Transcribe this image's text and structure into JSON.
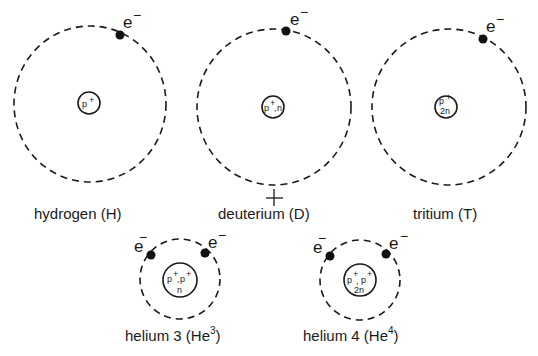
{
  "electron_label": "e",
  "electron_charge": "−",
  "atoms": [
    {
      "id": "hydrogen",
      "caption": "hydrogen (H)",
      "nucleus_lines": [
        "p+"
      ],
      "electrons": 1
    },
    {
      "id": "deuterium",
      "caption": "deuterium (D)",
      "nucleus_lines": [
        "p+,n"
      ],
      "electrons": 1
    },
    {
      "id": "tritium",
      "caption": "tritium (T)",
      "nucleus_lines": [
        "p+",
        "2n"
      ],
      "electrons": 1
    },
    {
      "id": "helium-3",
      "caption_main": "helium 3 (He",
      "caption_sup": "3",
      "caption_end": ")",
      "nucleus_lines": [
        "p+,p+",
        "n"
      ],
      "electrons": 2
    },
    {
      "id": "helium-4",
      "caption_main": "helium 4 (He",
      "caption_sup": "4",
      "caption_end": ")",
      "nucleus_lines": [
        "p+, p+",
        "2n"
      ],
      "electrons": 2
    }
  ],
  "nucleus_text": {
    "p": "p",
    "plus": "+",
    "n": "n",
    "two_n": "2n",
    "comma": ","
  },
  "mark": "+"
}
